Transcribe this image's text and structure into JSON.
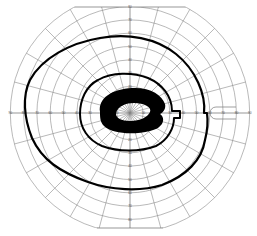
{
  "chart_data": {
    "type": "polar",
    "title": "",
    "center_px": [
      130,
      113
    ],
    "px_per_10deg": 13.3,
    "rings_deg": [
      10,
      20,
      30,
      40,
      50,
      60,
      70,
      80,
      90
    ],
    "meridians_deg": [
      0,
      15,
      30,
      45,
      60,
      75,
      90,
      105,
      120,
      135,
      150,
      165,
      180,
      195,
      210,
      225,
      240,
      255,
      270,
      285,
      300,
      315,
      330,
      345
    ],
    "horizontal_tick_labels_left": [
      "90",
      "80",
      "70",
      "60",
      "50",
      "40",
      "30",
      "20",
      "10"
    ],
    "horizontal_tick_labels_right": [
      "10",
      "20",
      "30",
      "40",
      "50",
      "60",
      "70",
      "80",
      "90"
    ],
    "vertical_tick_labels_up": [
      "10",
      "20",
      "30",
      "40",
      "50",
      "60",
      "70",
      "80"
    ],
    "vertical_tick_labels_down": [
      "10",
      "20",
      "30",
      "40",
      "50",
      "60",
      "70",
      "80"
    ],
    "blind_spot_marker": {
      "deg_x": 15,
      "description": "small rounded outline on right horizontal meridian near 70-80 deg"
    },
    "series": [
      {
        "name": "outer isopter",
        "style": "thick black line",
        "approx_extent_deg": {
          "temporal_left": 80,
          "nasal_right": 60,
          "superior": 65,
          "inferior": 65
        },
        "note": "right side has a step notch at the horizontal meridian"
      },
      {
        "name": "inner isopter",
        "style": "thick black line",
        "approx_extent_deg": {
          "left": 30,
          "right": 40,
          "superior": 28,
          "inferior": 40
        }
      },
      {
        "name": "central scotoma",
        "style": "filled black ring shape",
        "approx_extent_deg": {
          "left": 25,
          "right": 25,
          "superior": 10,
          "inferior": 12
        }
      }
    ],
    "xlim_deg": [
      -90,
      90
    ],
    "ylim_deg": [
      -85,
      80
    ],
    "grid": true,
    "legend": "none"
  }
}
